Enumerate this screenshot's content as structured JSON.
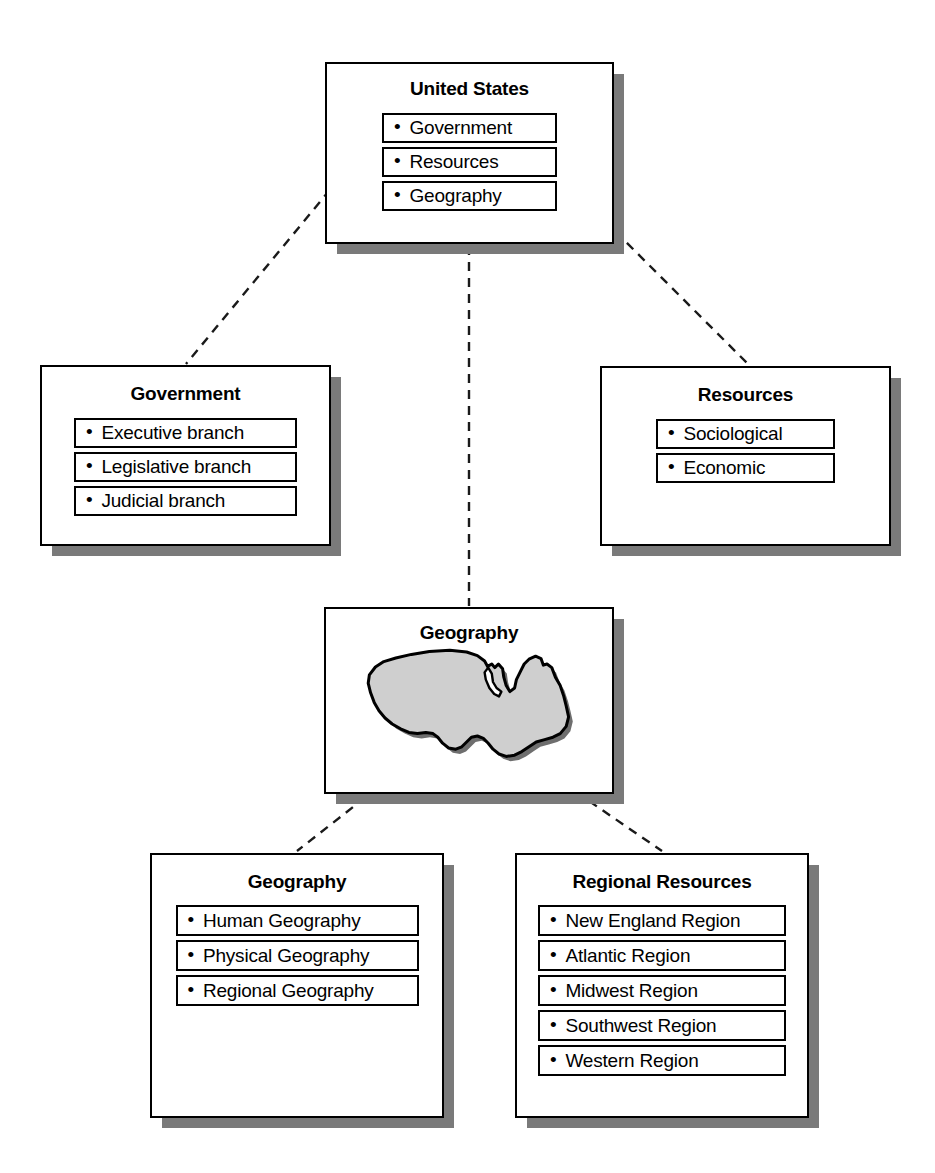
{
  "diagram": {
    "colors": {
      "background": "#ffffff",
      "border": "#000000",
      "shadow": "#7a7a7a",
      "map_fill": "#cfcfcf",
      "connector": "#1a1a1a"
    },
    "bullet_glyph": "•"
  },
  "nodes": {
    "united_states": {
      "title": "United States",
      "items": [
        {
          "label": "Government"
        },
        {
          "label": "Resources"
        },
        {
          "label": "Geography"
        }
      ]
    },
    "government": {
      "title": "Government",
      "items": [
        {
          "label": "Executive branch"
        },
        {
          "label": "Legislative branch"
        },
        {
          "label": "Judicial branch"
        }
      ]
    },
    "resources": {
      "title": "Resources",
      "items": [
        {
          "label": "Sociological"
        },
        {
          "label": "Economic"
        }
      ]
    },
    "geography_map": {
      "title": "Geography",
      "image_name": "united-states-map-illustration"
    },
    "geography": {
      "title": "Geography",
      "items": [
        {
          "label": "Human Geography"
        },
        {
          "label": "Physical Geography"
        },
        {
          "label": "Regional Geography"
        }
      ]
    },
    "regional_resources": {
      "title": "Regional Resources",
      "items": [
        {
          "label": "New England Region"
        },
        {
          "label": "Atlantic Region"
        },
        {
          "label": "Midwest Region"
        },
        {
          "label": "Southwest Region"
        },
        {
          "label": "Western Region"
        }
      ]
    }
  },
  "connections": [
    {
      "from": "united_states.items.0",
      "to": "government"
    },
    {
      "from": "united_states.items.1",
      "to": "resources"
    },
    {
      "from": "united_states.items.2",
      "to": "geography_map"
    },
    {
      "from": "geography_map",
      "to": "geography"
    },
    {
      "from": "geography_map",
      "to": "regional_resources"
    }
  ]
}
